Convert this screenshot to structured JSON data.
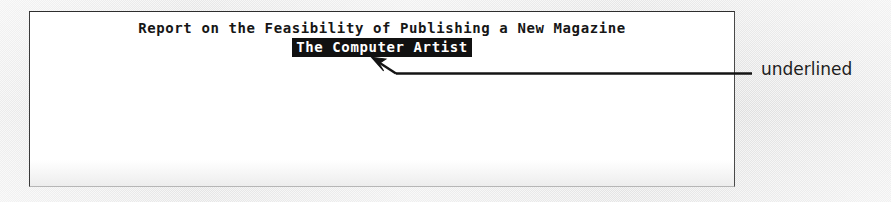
{
  "figure": {
    "kind": "scanned-document-figure",
    "background_color": "#eeeeee",
    "panel_color": "#ffffff"
  },
  "document": {
    "title_line": "Report on the Feasibility of Publishing a New Magazine",
    "subtitle_line": "The Computer Artist",
    "subtitle_style": "inverse-video",
    "subtitle_background": "#111111",
    "subtitle_foreground": "#ffffff",
    "text_color": "#161616"
  },
  "annotation": {
    "label": "underlined",
    "label_color": "#1d1d1d",
    "leader_color": "#141414",
    "arrow_target": "document.subtitle_line",
    "arrow_tip": {
      "x": 372,
      "y": 58
    },
    "leader_start": {
      "x": 394,
      "y": 73
    },
    "leader_end": {
      "x": 752,
      "y": 73
    }
  }
}
